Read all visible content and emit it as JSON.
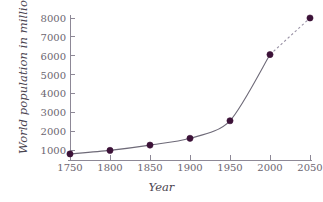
{
  "chart_data": {
    "type": "line",
    "title": "",
    "xlabel": "Year",
    "ylabel": "World population in millions",
    "x": [
      1750,
      1800,
      1850,
      1900,
      1950,
      2000,
      2050
    ],
    "values": [
      790,
      980,
      1260,
      1620,
      2550,
      6060,
      8000
    ],
    "series": [
      {
        "name": "World population",
        "values": [
          790,
          980,
          1260,
          1620,
          2550,
          6060,
          8000
        ],
        "style": "solid-with-dashed-projection",
        "projection_from": 2000,
        "color": "#3c1238"
      }
    ],
    "xlim": [
      1725,
      2075
    ],
    "ylim": [
      0,
      8400
    ],
    "xticks": [
      1750,
      1800,
      1850,
      1900,
      1950,
      2000,
      2050
    ],
    "yticks": [
      1000,
      2000,
      3000,
      4000,
      5000,
      6000,
      7000,
      8000
    ],
    "xtick_labels": [
      "1750",
      "1800",
      "1850",
      "1900",
      "1950",
      "2000",
      "2050"
    ],
    "ytick_labels": [
      "1000",
      "2000",
      "3000",
      "4000",
      "5000",
      "6000",
      "7000",
      "8000"
    ],
    "grid": false,
    "legend": "none",
    "marker": "filled-circle",
    "marker_color": "#3c1238",
    "line_color": "#6e6a78",
    "dashed_segment_color": "#9a93a6",
    "axis_color": "#8d8896",
    "text_color": "#4a4450"
  }
}
